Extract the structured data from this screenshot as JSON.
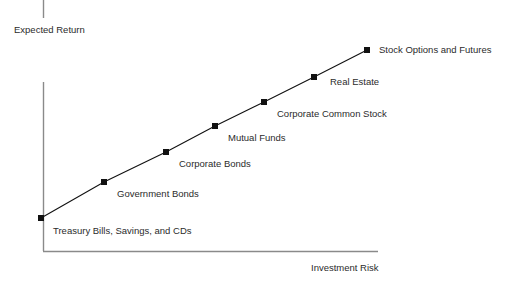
{
  "figure": {
    "background_color": "#ffffff",
    "width": 518,
    "height": 285
  },
  "chart_data": {
    "type": "line",
    "title": "",
    "subtitle": "",
    "xlabel": "Investment Risk",
    "ylabel": "Expected Return",
    "grid": false,
    "legend": "none",
    "axis_color": "#8a8a8a",
    "line_color": "#111111",
    "marker_color": "#111111",
    "marker_shape": "square",
    "xlim": [
      0,
      10
    ],
    "ylim": [
      0,
      10
    ],
    "axis_ticks": [],
    "annotation_note": "Risk-return tradeoff: each asset class plotted along an upward-sloping line; both axes are qualitative with no numeric tick labels.",
    "categories": [
      "Treasury Bills, Savings, and CDs",
      "Government Bonds",
      "Corporate Bonds",
      "Mutual Funds",
      "Corporate Common Stock",
      "Real Estate",
      "Stock Options and Futures"
    ],
    "points": [
      {
        "label": "Treasury Bills, Savings, and CDs",
        "risk": 0.0,
        "return": 0.0,
        "px": 41,
        "py": 218,
        "label_x": 53,
        "label_y": 225
      },
      {
        "label": "Government Bonds",
        "risk": 1.9,
        "return": 1.9,
        "px": 104,
        "py": 182,
        "label_x": 117,
        "label_y": 188
      },
      {
        "label": "Corporate Bonds",
        "risk": 3.8,
        "return": 3.8,
        "px": 166,
        "py": 152,
        "label_x": 179,
        "label_y": 158
      },
      {
        "label": "Mutual Funds",
        "risk": 5.3,
        "return": 5.3,
        "px": 215,
        "py": 126,
        "label_x": 228,
        "label_y": 132
      },
      {
        "label": "Corporate Common Stock",
        "risk": 6.8,
        "return": 6.8,
        "px": 264,
        "py": 102,
        "label_x": 277,
        "label_y": 108
      },
      {
        "label": "Real Estate",
        "risk": 8.4,
        "return": 8.4,
        "px": 314,
        "py": 77,
        "label_x": 330,
        "label_y": 76
      },
      {
        "label": "Stock Options and Futures",
        "risk": 10.0,
        "return": 10.0,
        "px": 367,
        "py": 50,
        "label_x": 379,
        "label_y": 44
      }
    ]
  },
  "axes": {
    "y_axis": {
      "x": 43,
      "y_top": 82,
      "y_bottom": 251
    },
    "x_axis": {
      "y": 251,
      "x_left": 43,
      "x_right": 378
    },
    "top_tick": {
      "x": 43,
      "y_top": 0,
      "y_bottom": 18
    }
  }
}
